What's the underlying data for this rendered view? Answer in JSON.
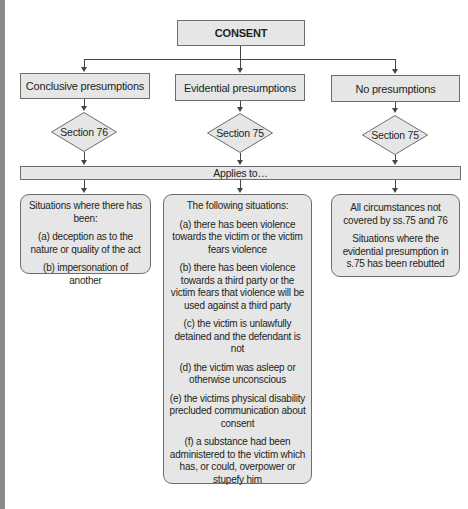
{
  "diagram": {
    "root": {
      "label": "CONSENT"
    },
    "branches": [
      {
        "label": "Conclusive presumptions",
        "section": "Section 76",
        "applies": {
          "heading": "Situations where there has been:",
          "items": [
            "(a) deception as to the nature or quality of the act",
            "(b) impersonation of another"
          ]
        }
      },
      {
        "label": "Evidential presumptions",
        "section": "Section 75",
        "applies": {
          "heading": "The following situations:",
          "items": [
            "(a) there has been violence towards the victim or the victim fears violence",
            "(b) there has been violence towards a third party or the victim fears that violence will be used against a third party",
            "(c) the victim is unlawfully detained and the defendant is not",
            "(d) the victim was asleep or otherwise unconscious",
            "(e) the victims physical disability precluded communication about consent",
            "(f) a substance had been administered to the victim which has, or could, overpower or stupefy him"
          ]
        }
      },
      {
        "label": "No presumptions",
        "section": "Section 75",
        "applies": {
          "heading": "All circumstances not covered by ss.75 and 76",
          "items": [
            "Situations where the evidential presumption in s.75 has been rebutted"
          ]
        }
      }
    ],
    "applies_bar": "Applies to…"
  },
  "colors": {
    "box_fill": "#e6e6e6",
    "border": "#6d6d6d",
    "connector": "#444444",
    "side_strip": "#8a8a8a"
  }
}
